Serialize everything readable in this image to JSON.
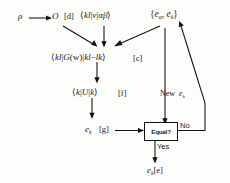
{
  "diagram": {
    "nodes": {
      "rho": "ρ",
      "overlap": "O",
      "tag_d": "[d]",
      "two_electron": "⟨kl|v|αβ⟩",
      "energy_set": "{eₐ, eₖ}",
      "green_function": "⟨kl|G(w)|kl−lk⟩",
      "tag_c": "[c]",
      "fock_matrix": "⟨k|U|k⟩",
      "tag_f": "[f]",
      "ek_trial": "eₖ",
      "tag_g": "[g]",
      "decision": "Equal?",
      "branch_no": "No",
      "branch_yes": "Yes",
      "new_ek": "New eₖ",
      "ek_final": "eₖ",
      "tag_e": "[e]"
    },
    "parts": {
      "bra_open": "⟨",
      "ket_close": "⟩",
      "bar": "|",
      "brace_open": "{",
      "brace_close": "}",
      "comma": ",",
      "k": "k",
      "l": "l",
      "v": "v",
      "alpha": "α",
      "beta": "β",
      "G": "G",
      "w_paren": "(w)",
      "minus": "−",
      "U": "U",
      "e": "e",
      "sub_a": "a",
      "sub_k": "k",
      "new_word": "New"
    },
    "colors": {
      "ink": "#111111",
      "background": "#fdfdfb"
    }
  }
}
